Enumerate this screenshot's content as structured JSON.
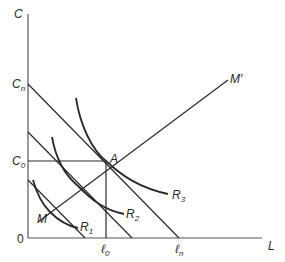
{
  "diagram": {
    "type": "economics-indifference-budget",
    "axes": {
      "y_label": "C",
      "x_label": "L",
      "origin_label": "0"
    },
    "y_ticks": [
      {
        "base": "C",
        "sub": "n"
      },
      {
        "base": "C",
        "sub": "0"
      }
    ],
    "x_ticks": [
      {
        "base": "ℓ",
        "sub": "0"
      },
      {
        "base": "ℓ",
        "sub": "n"
      }
    ],
    "points": {
      "A": "A",
      "M": "M",
      "M_prime": "M′"
    },
    "curves": [
      {
        "base": "R",
        "sub": "1"
      },
      {
        "base": "R",
        "sub": "2"
      },
      {
        "base": "R",
        "sub": "3"
      }
    ],
    "colors": {
      "line": "#2a2a2a",
      "axis": "#555555",
      "background": "#ffffff"
    }
  }
}
